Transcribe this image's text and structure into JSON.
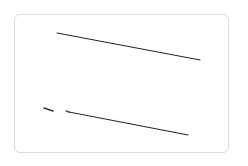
{
  "canvas": {
    "width": 248,
    "height": 166,
    "background": "#ffffff"
  },
  "card": {
    "border_color": "#dcdcdc",
    "background": "#ffffff"
  },
  "strokes": [
    {
      "x1": 57,
      "y1": 33,
      "x2": 200,
      "y2": 60,
      "color": "#222222",
      "width": 1
    },
    {
      "x1": 44,
      "y1": 108,
      "x2": 53,
      "y2": 111,
      "color": "#333333",
      "width": 1.4
    },
    {
      "x1": 66,
      "y1": 111,
      "x2": 69,
      "y2": 112,
      "color": "#555555",
      "width": 1.4
    },
    {
      "x1": 69,
      "y1": 112,
      "x2": 188,
      "y2": 135,
      "color": "#222222",
      "width": 1
    }
  ]
}
